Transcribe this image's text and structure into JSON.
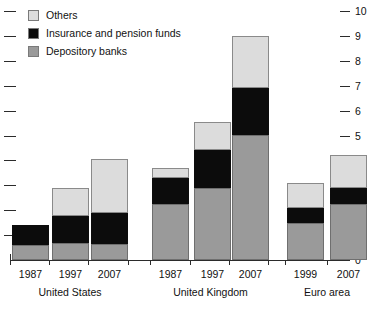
{
  "chart_data": {
    "type": "bar",
    "title": "",
    "subtitle": "",
    "xlabel": "",
    "ylabel": "",
    "ylim": [
      0,
      10
    ],
    "y_ticks": [
      "0",
      "1",
      "2",
      "3",
      "4",
      "5",
      "6",
      "7",
      "8",
      "9",
      "10"
    ],
    "grid": false,
    "stacked": true,
    "legend_position": "top-left",
    "legend": [
      "Others",
      "Insurance and pension funds",
      "Depository banks"
    ],
    "series": [
      {
        "name": "Depository banks",
        "color": "#9a9a9a",
        "values": [
          0.6,
          0.7,
          0.65,
          2.25,
          2.9,
          5.0,
          1.5,
          2.25
        ]
      },
      {
        "name": "Insurance and pension funds",
        "color": "#0c0c0c",
        "values": [
          0.8,
          1.05,
          1.25,
          1.05,
          1.5,
          1.9,
          0.6,
          0.65
        ]
      },
      {
        "name": "Others",
        "color": "#dcdcdc",
        "values": [
          0.0,
          1.15,
          2.15,
          0.4,
          1.15,
          2.1,
          1.0,
          1.3
        ]
      }
    ],
    "categories": [
      "1987",
      "1997",
      "2007",
      "1987",
      "1997",
      "2007",
      "1999",
      "2007"
    ],
    "totals": [
      1.4,
      2.9,
      4.05,
      3.7,
      5.55,
      9.0,
      3.1,
      4.2
    ],
    "groups": [
      {
        "label": "United States",
        "categories": [
          "1987",
          "1997",
          "2007"
        ]
      },
      {
        "label": "United Kingdom",
        "categories": [
          "1987",
          "1997",
          "2007"
        ]
      },
      {
        "label": "Euro area",
        "categories": [
          "1999",
          "2007"
        ]
      }
    ]
  },
  "axis": {
    "ticks": [
      {
        "label": "10",
        "value": 10
      },
      {
        "label": "9",
        "value": 9
      },
      {
        "label": "8",
        "value": 8
      },
      {
        "label": "7",
        "value": 7
      },
      {
        "label": "6",
        "value": 6
      },
      {
        "label": "5",
        "value": 5
      },
      {
        "label": "4",
        "value": 4
      },
      {
        "label": "3",
        "value": 3
      },
      {
        "label": "2",
        "value": 2
      },
      {
        "label": "1",
        "value": 1
      },
      {
        "label": "0",
        "value": 0
      }
    ]
  },
  "legend": {
    "items": [
      {
        "label": "Others",
        "color": "#dcdcdc"
      },
      {
        "label": "Insurance and pension funds",
        "color": "#0c0c0c"
      },
      {
        "label": "Depository banks",
        "color": "#9a9a9a"
      }
    ]
  }
}
